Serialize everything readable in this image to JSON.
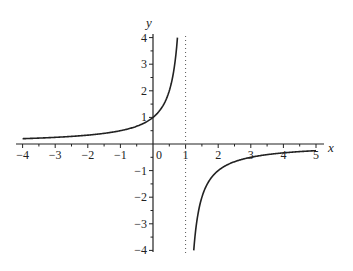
{
  "chart_data": {
    "type": "line",
    "title": "",
    "function": "y = 1/(1 - x)",
    "xlabel": "x",
    "ylabel": "y",
    "xlim": [
      -4,
      5
    ],
    "ylim": [
      -4,
      4
    ],
    "x_ticks": [
      -4,
      -3,
      -2,
      -1,
      0,
      1,
      2,
      3,
      4,
      5
    ],
    "x_tick_labels": [
      "−4",
      "−3",
      "−2",
      "−1",
      "0",
      "1",
      "2",
      "3",
      "4",
      "5"
    ],
    "y_ticks": [
      -4,
      -3,
      -2,
      -1,
      1,
      2,
      3,
      4
    ],
    "y_tick_labels": [
      "−4",
      "−3",
      "−2",
      "−1",
      "1",
      "2",
      "3",
      "4"
    ],
    "grid": false,
    "legend": null,
    "asymptote": {
      "type": "vertical",
      "x": 1,
      "style": "dotted"
    },
    "series": [
      {
        "name": "branch-left",
        "x": [
          -4,
          -3,
          -2,
          -1,
          0,
          0.5,
          0.75
        ],
        "y": [
          0.2,
          0.25,
          0.333,
          0.5,
          1,
          2,
          4
        ]
      },
      {
        "name": "branch-right",
        "x": [
          1.25,
          1.5,
          2,
          3,
          4,
          5
        ],
        "y": [
          -4,
          -2,
          -1,
          -0.5,
          -0.333,
          -0.25
        ]
      }
    ],
    "colors": {
      "curve": "#222222",
      "axes": "#222222",
      "asymptote": "#555555"
    }
  }
}
